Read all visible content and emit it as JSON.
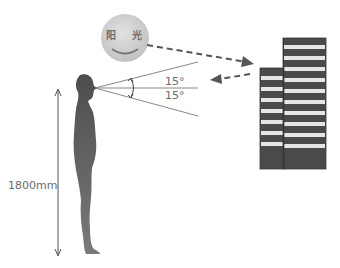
{
  "diagram": {
    "sun": {
      "text": "阳 光",
      "icon": "smiling-sun-icon",
      "color": "#c9c9c9"
    },
    "view_angle": {
      "upper": "15°",
      "lower": "15°"
    },
    "person": {
      "height_label": "1800mm",
      "color": "#555555"
    },
    "building": {
      "icon": "striped-building-icon",
      "dark_color": "#4a4a4a",
      "light_stripe_color": "#e8e8e8"
    },
    "arrows": {
      "sun_to_building": "dashed-arrow-right",
      "building_to_eye": "dashed-arrow-left"
    }
  }
}
